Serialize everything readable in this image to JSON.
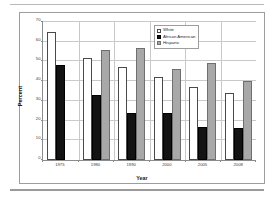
{
  "chart_data": {
    "type": "bar",
    "title": "",
    "xlabel": "Year",
    "ylabel": "Percent",
    "categories": [
      "1975",
      "1980",
      "1990",
      "2000",
      "2005",
      "2008"
    ],
    "series": [
      {
        "name": "White",
        "values": [
          65,
          52,
          47,
          42,
          37,
          34
        ],
        "color": "#ffffff"
      },
      {
        "name": "African American",
        "values": [
          48,
          33,
          24,
          24,
          17,
          16
        ],
        "color": "#131313"
      },
      {
        "name": "Hispanic",
        "values": [
          null,
          56,
          57,
          46,
          49,
          40
        ],
        "color": "#a8a8a8"
      }
    ],
    "ylim": [
      0,
      70
    ],
    "yticks": [
      0,
      10,
      20,
      30,
      40,
      50,
      60,
      70
    ],
    "grid": true,
    "legend_position": "top-right"
  },
  "legend": {
    "items": [
      {
        "label": "White"
      },
      {
        "label": "African American"
      },
      {
        "label": "Hispanic"
      }
    ]
  },
  "axes": {
    "y_title": "Percent",
    "x_title": "Year"
  }
}
